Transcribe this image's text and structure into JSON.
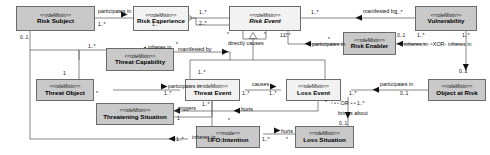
{
  "diagram": {
    "kind": "uml-class-diagram",
    "classes": [
      {
        "id": "risk-subject",
        "stereotype": "<<roleMixin>>",
        "name": "Risk Subject",
        "fill": "gray",
        "abstract": false
      },
      {
        "id": "risk-experience",
        "stereotype": "<<roleMixin>>",
        "name": "Risk Experience",
        "fill": "white",
        "abstract": false
      },
      {
        "id": "risk-event",
        "stereotype": "<<roleMixin>>",
        "name": "Risk Event",
        "fill": "white",
        "abstract": true
      },
      {
        "id": "vulnerability",
        "stereotype": "<<roleMixin>>",
        "name": "Vulnerability",
        "fill": "gray",
        "abstract": false
      },
      {
        "id": "risk-enabler",
        "stereotype": "<<roleMixin>>",
        "name": "Risk Enabler",
        "fill": "gray",
        "abstract": false
      },
      {
        "id": "threat-capability",
        "stereotype": "<<roleMixin>>",
        "name": "Threat Capability",
        "fill": "gray",
        "abstract": false
      },
      {
        "id": "threat-object",
        "stereotype": "<<roleMixin>>",
        "name": "Threat Object",
        "fill": "gray",
        "abstract": false
      },
      {
        "id": "threat-event",
        "stereotype": "<<roleMixin>>",
        "name": "Threat Event",
        "fill": "white",
        "abstract": false
      },
      {
        "id": "loss-event",
        "stereotype": "<<roleMixin>>",
        "name": "Loss Event",
        "fill": "white",
        "abstract": false
      },
      {
        "id": "object-at-risk",
        "stereotype": "<<roleMixin>>",
        "name": "Object at Risk",
        "fill": "gray",
        "abstract": false
      },
      {
        "id": "threatening-situation",
        "stereotype": "<<roleMixin>>",
        "name": "Threatening Situation",
        "fill": "gray",
        "abstract": false
      },
      {
        "id": "ufo-intention",
        "stereotype": "<<mode>>",
        "name": "UFO:Intention",
        "fill": "gray",
        "abstract": false
      },
      {
        "id": "loss-situation",
        "stereotype": "<<roleMixin>>",
        "name": "Loss Situation",
        "fill": "gray",
        "abstract": false
      }
    ],
    "association_labels": {
      "participates_in_1": "participates in",
      "manifested_by_1": "manifested by",
      "directly_causes": "directly causes",
      "inheres_in_1": "inheres in",
      "manifested_by_2": "manifested by",
      "participates_in_2": "participates in",
      "inheres_in_2": "inheres in",
      "inheres_in_3": "inheres in",
      "xor": "-XOR-",
      "participates_in_3": "participates in",
      "causes": "causes",
      "participates_in_4": "participates in",
      "triggers": "triggers",
      "hurts_1": "hurts",
      "hurts_2": "hurts",
      "or": "- - OR - -",
      "brings_about": "brings about",
      "inheres_in_4": "inheres in"
    },
    "multiplicities": {
      "rs_pi": "1..*",
      "re_pi": "1..*",
      "re_risk_top": "1..*",
      "re_risk_bot": "2..*",
      "risk_mb": "1..*",
      "vuln_mb": "1..*",
      "dc_left": "*",
      "dc_right": "*",
      "risk_pi_enabler": "1..*",
      "enabler_pi": "*",
      "enabler_inheres": "0..1",
      "vuln_inheres": "1..*",
      "xor_left": "1..*",
      "xor_right": "1..*",
      "rs_inheres": "0..1",
      "tc_inheres": "1..*",
      "tc_mb": "*",
      "to_inheres": "1",
      "to_pi": "*",
      "te_pi": "1..*",
      "te_causes": "1..*",
      "le_causes": "1..*",
      "le_pi": "1..*",
      "oar_pi": "0..1",
      "oar_top": "0..1",
      "te_triggers": "1..*",
      "ts_triggers": "1",
      "le_hurts": "*",
      "le_or": "1..*",
      "ui_hurts": "1..*",
      "ui_inheres": "1..*",
      "ui_trig": "*",
      "ls_hurts": "*",
      "brings_about_m": "0..1"
    }
  }
}
